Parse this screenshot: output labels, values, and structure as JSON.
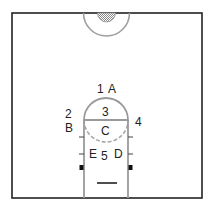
{
  "diagram": {
    "type": "basketball-half-court",
    "colors": {
      "court_line": "#222222",
      "lane_line": "#9a9a9a",
      "center_fill": "#a8a8a8",
      "label": "#222222"
    },
    "labels": {
      "pos_1": "1",
      "pos_A": "A",
      "pos_2": "2",
      "pos_B": "B",
      "pos_3": "3",
      "pos_C": "C",
      "pos_4": "4",
      "pos_E": "E",
      "pos_5": "5",
      "pos_D": "D"
    }
  }
}
